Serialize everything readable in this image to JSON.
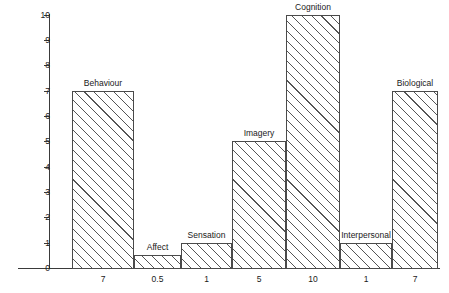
{
  "chart_data": {
    "type": "bar",
    "title": "",
    "xlabel": "",
    "ylabel": "",
    "ylim": [
      0,
      10
    ],
    "grid": false,
    "legend": "none",
    "categories": [
      "Behaviour",
      "Affect",
      "Sensation",
      "Imagery",
      "Cognition",
      "Interpersonal",
      "Biological"
    ],
    "values": [
      7,
      0.5,
      1,
      5,
      10,
      1,
      7
    ],
    "x_tick_labels": [
      "7",
      "0.5",
      "1",
      "5",
      "10",
      "1",
      "7"
    ],
    "y_tick_labels": [
      "0",
      "1",
      "2",
      "3",
      "4",
      "5",
      "6",
      "7",
      "8",
      "9",
      "10"
    ],
    "bar_style": "diagonal-hatch",
    "bar_edge_color": "#4a4a4a",
    "bar_fill_color": "#ffffff",
    "axis_color": "#3a3a3a",
    "background_color": "#ffffff"
  },
  "bars": [
    {
      "label": "Behaviour",
      "value": 7,
      "tick": "7",
      "left": 72,
      "right": 134
    },
    {
      "label": "Affect",
      "value": 0.5,
      "tick": "0.5",
      "left": 134,
      "right": 181
    },
    {
      "label": "Sensation",
      "value": 1,
      "tick": "1",
      "left": 181,
      "right": 232
    },
    {
      "label": "Imagery",
      "value": 5,
      "tick": "5",
      "left": 232,
      "right": 286
    },
    {
      "label": "Cognition",
      "value": 10,
      "tick": "10",
      "left": 286,
      "right": 340
    },
    {
      "label": "Interpersonal",
      "value": 1,
      "tick": "1",
      "left": 340,
      "right": 392
    },
    {
      "label": "Biological",
      "value": 7,
      "tick": "7",
      "left": 392,
      "right": 438
    }
  ],
  "y_axis": {
    "ticks": [
      {
        "label": "10"
      },
      {
        "label": "9"
      },
      {
        "label": "8"
      },
      {
        "label": "7"
      },
      {
        "label": "6"
      },
      {
        "label": "5"
      },
      {
        "label": "4"
      },
      {
        "label": "3"
      },
      {
        "label": "2"
      },
      {
        "label": "1"
      },
      {
        "label": "0"
      }
    ]
  }
}
